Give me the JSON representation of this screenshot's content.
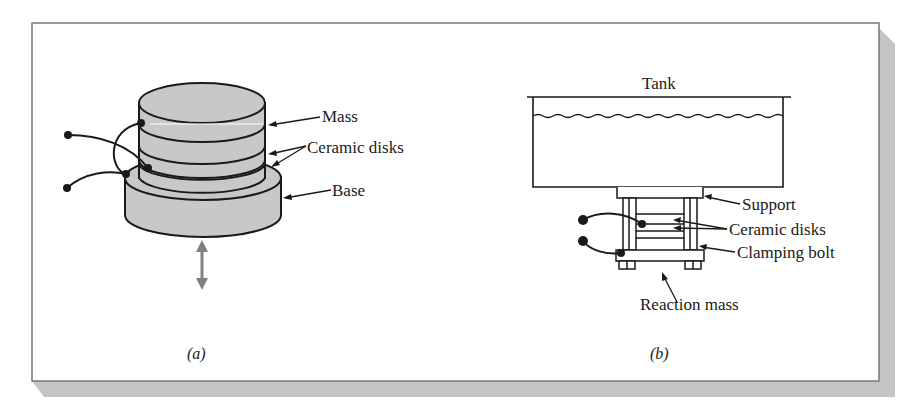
{
  "figure": {
    "panel_a": {
      "caption": "(a)",
      "labels": {
        "mass": "Mass",
        "ceramic_disks": "Ceramic disks",
        "base": "Base"
      }
    },
    "panel_b": {
      "caption": "(b)",
      "labels": {
        "tank": "Tank",
        "support": "Support",
        "ceramic_disks": "Ceramic disks",
        "clamping_bolt": "Clamping bolt",
        "reaction_mass": "Reaction mass"
      }
    },
    "colors": {
      "frame_border": "#777777",
      "shadow": "#c4c4c4",
      "fill_gray": "#c8c8c8",
      "stroke": "#1a1a1a",
      "arrow_gray": "#808080"
    }
  }
}
